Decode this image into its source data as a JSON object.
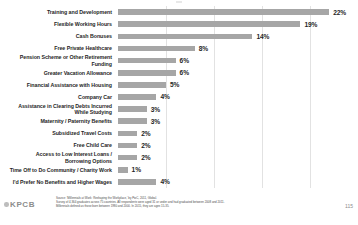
{
  "chart_data": {
    "type": "bar",
    "orientation": "horizontal",
    "title": "",
    "xlabel": "",
    "ylabel": "",
    "xlim": [
      0,
      25
    ],
    "grid": true,
    "gridline_values": [
      5,
      10,
      15,
      20,
      25
    ],
    "bar_color": "#a6a6a6",
    "value_suffix": "%",
    "categories": [
      "Training and Development",
      "Flexible Working Hours",
      "Cash Bonuses",
      "Free Private Healthcare",
      "Pension Scheme or Other Retirement Funding",
      "Greater Vacation Allowance",
      "Financial Assistance with Housing",
      "Company Car",
      "Assistance in Clearing Debts Incurred While Studying",
      "Maternity / Paternity Benefits",
      "Subsidized Travel Costs",
      "Free Child Care",
      "Access to Low Interest Loans / Borrowing Options",
      "Time Off to Do Community / Charity Work",
      "I'd Prefer No Benefits and Higher Wages"
    ],
    "category_lines": [
      [
        "Training and Development"
      ],
      [
        "Flexible Working Hours"
      ],
      [
        "Cash Bonuses"
      ],
      [
        "Free Private Healthcare"
      ],
      [
        "Pension Scheme or Other Retirement",
        "Funding"
      ],
      [
        "Greater Vacation Allowance"
      ],
      [
        "Financial Assistance with Housing"
      ],
      [
        "Company Car"
      ],
      [
        "Assistance in Clearing Debts Incurred",
        "While Studying"
      ],
      [
        "Maternity / Paternity Benefits"
      ],
      [
        "Subsidized Travel Costs"
      ],
      [
        "Free Child Care"
      ],
      [
        "Access to Low Interest Loans /",
        "Borrowing Options"
      ],
      [
        "Time Off to Do Community / Charity Work"
      ],
      [
        "I'd Prefer No Benefits and Higher Wages"
      ]
    ],
    "values": [
      22,
      19,
      14,
      8,
      6,
      6,
      5,
      4,
      3,
      3,
      2,
      2,
      2,
      1,
      4
    ],
    "value_labels": [
      "22%",
      "19%",
      "14%",
      "8%",
      "6%",
      "6%",
      "5%",
      "4%",
      "3%",
      "3%",
      "2%",
      "2%",
      "2%",
      "1%",
      "4%"
    ]
  },
  "footer": {
    "logo_text": "KPCB",
    "source_lines": [
      "Source: 'Millennials at Work: Reshaping the Workplace,' by PwC, 2011, Global.",
      "Survey of 4,364 graduates across 75 countries. All respondents were aged 31 or under and had graduated between 2008 and 2011.",
      "Millennials defined as those born between 1980 and 2000. In 2015, they are ages 15-35."
    ],
    "page_number": "115"
  }
}
